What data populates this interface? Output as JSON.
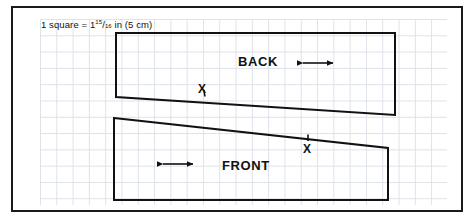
{
  "figure": {
    "name": "sewing-pattern-layout-diagram",
    "caption": {
      "prefix": "1 square  =  1",
      "fraction_numerator": "15",
      "fraction_slash": "/",
      "fraction_denominator": "16",
      "suffix": " in  (5 cm)"
    },
    "colors": {
      "border": "#1a1a1a",
      "grid_line": "#dde1e9",
      "pattern_outline": "#111111",
      "background": "#ffffff",
      "text": "#111111"
    },
    "grid": {
      "square_size_px": 16.3,
      "square_equals_inches": "1 15/16 in",
      "square_equals_cm": "5 cm"
    }
  },
  "pieces": [
    {
      "id": "back",
      "label": "BACK",
      "outline_points": "116,33 395,33 395,115 116,97",
      "grainline": {
        "name": "grainline-arrow-back",
        "x1": 300,
        "y1": 63,
        "x2": 336,
        "y2": 63
      },
      "notch": {
        "label": "X",
        "tick_x": 204,
        "tick_y1": 90,
        "tick_y2": 97
      }
    },
    {
      "id": "front",
      "label": "FRONT",
      "outline_points": "114,118 388,148 388,200 114,200",
      "grainline": {
        "name": "grainline-arrow-front",
        "x1": 160,
        "y1": 164,
        "x2": 196,
        "y2": 164
      },
      "notch": {
        "label": "X",
        "tick_x": 308,
        "tick_y1": 134,
        "tick_y2": 141
      }
    }
  ]
}
